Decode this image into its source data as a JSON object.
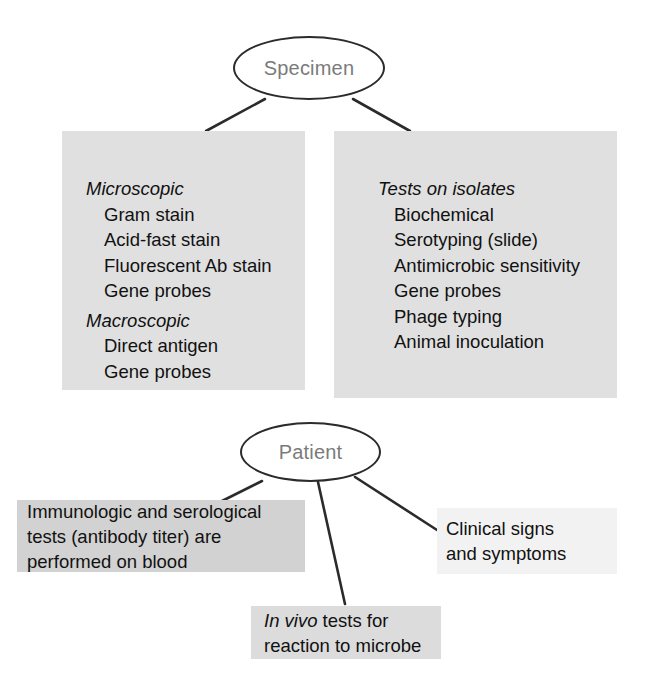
{
  "diagram": {
    "colors": {
      "panel_fill": "#e0e0e0",
      "callout_fill_dark": "#d2d2d2",
      "callout_fill_mid": "#dcdcdc",
      "callout_fill_light": "#f2f2f2",
      "line": "#2b2b2b",
      "ellipse_label": "#7b7b7b",
      "text": "#111111",
      "background": "#ffffff"
    },
    "nodes": {
      "specimen": {
        "label": "Specimen"
      },
      "patient": {
        "label": "Patient"
      }
    },
    "panels": [
      {
        "id": "direct-testing",
        "title": "Direct Testing",
        "groups": [
          {
            "heading": "Microscopic",
            "items": [
              "Gram stain",
              "Acid-fast stain",
              "Fluorescent Ab stain",
              "Gene probes"
            ]
          },
          {
            "heading": "Macroscopic",
            "items": [
              "Direct antigen",
              "Gene probes"
            ]
          }
        ]
      },
      {
        "id": "culture-isolation",
        "title": "Culture/Isolation",
        "groups": [
          {
            "heading": "Tests on isolates",
            "items": [
              "Biochemical",
              "Serotyping (slide)",
              "Antimicrobic sensitivity",
              "Gene probes",
              "Phage typing",
              "Animal inoculation"
            ]
          }
        ]
      }
    ],
    "callouts": [
      {
        "id": "serology",
        "line1": "Immunologic and serological",
        "line2": "tests (antibody titer) are",
        "line3": "performed on blood"
      },
      {
        "id": "clinical-signs",
        "line1": "Clinical signs",
        "line2": "and symptoms"
      },
      {
        "id": "in-vivo",
        "line1_italic": "In vivo",
        "line1_rest": " tests for",
        "line2": "reaction to microbe"
      }
    ]
  }
}
